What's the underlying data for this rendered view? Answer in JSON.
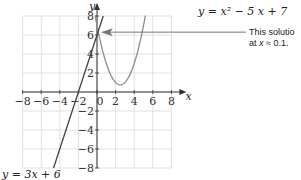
{
  "chart_data": {
    "type": "line",
    "title": "",
    "xlabel": "x",
    "ylabel": "y",
    "xlim": [
      -8,
      8
    ],
    "ylim": [
      -8,
      8
    ],
    "grid": true,
    "x_ticks": [
      -8,
      -6,
      -4,
      -2,
      0,
      2,
      4,
      6,
      8
    ],
    "y_ticks": [
      -8,
      -6,
      -4,
      -2,
      2,
      4,
      6,
      8
    ],
    "series": [
      {
        "name": "y = x² − 5x + 7",
        "kind": "parabola",
        "equation": "y = x^2 - 5x + 7",
        "coefficients": {
          "a": 1,
          "b": -5,
          "c": 7
        },
        "x": [
          -0.2,
          0,
          0.5,
          1,
          1.5,
          2,
          2.5,
          3,
          3.5,
          4,
          4.5,
          5,
          5.2
        ],
        "y": [
          8.04,
          7,
          4.75,
          3,
          1.75,
          1,
          0.75,
          1,
          1.75,
          3,
          4.75,
          7,
          8.04
        ]
      },
      {
        "name": "y = 3x + 6",
        "kind": "line",
        "equation": "y = 3x + 6",
        "coefficients": {
          "m": 3,
          "b": 6
        },
        "x": [
          -4.67,
          0.67
        ],
        "y": [
          -8,
          8
        ]
      }
    ],
    "annotations": [
      {
        "text": "This solution is at x ≈ 0.1.",
        "points_to": {
          "x": 0.1,
          "y": 6.3
        },
        "type": "arrow"
      }
    ]
  },
  "labels": {
    "y_axis": "y",
    "x_axis": "x",
    "origin": "0",
    "parabola_eq": "y = x² − 5 x + 7",
    "line_eq": "y = 3x + 6",
    "annotation_line1": "This solutio",
    "annotation_line2_prefix": "at ",
    "annotation_line2_var": "x",
    "annotation_line2_suffix": " ≈ 0.1."
  },
  "colors": {
    "grid": "#d9d9d9",
    "axis": "#333333",
    "parabola": "#8c8c8c",
    "line": "#444444",
    "arrow": "#777777"
  }
}
